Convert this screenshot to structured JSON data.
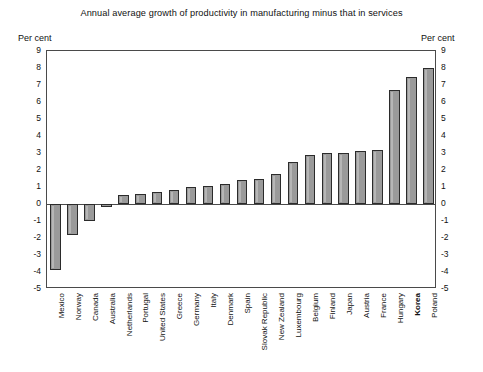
{
  "chart_data": {
    "type": "bar",
    "title": "Annual average growth of productivity in manufacturing minus that in services",
    "xlabel": "",
    "ylabel": "Per cent",
    "ylabel_right": "Per cent",
    "ylim": [
      -5,
      9
    ],
    "yticks": [
      9,
      8,
      7,
      6,
      5,
      4,
      3,
      2,
      1,
      0,
      -1,
      -2,
      -3,
      -4,
      -5
    ],
    "ytick_labels": [
      "9",
      "8",
      "7",
      "6",
      "5",
      "4",
      "3",
      "2",
      "1",
      "0",
      "-1",
      "-2",
      "-3",
      "-4",
      "-5"
    ],
    "grid": false,
    "legend": null,
    "bar_color": "#9a9a9a",
    "bar_edge_color": "#2b2b2b",
    "frame_color": "#4a4a4a",
    "highlight_category": "Korea",
    "categories": [
      "Mexico",
      "Norway",
      "Canada",
      "Australia",
      "Netherlands",
      "Portugal",
      "United States",
      "Greece",
      "Germany",
      "Italy",
      "Denmark",
      "Spain",
      "Slovak Republic",
      "New Zealand",
      "Luxembourg",
      "Belgium",
      "Finland",
      "Japan",
      "Austria",
      "France",
      "Hungary",
      "Korea",
      "Poland"
    ],
    "values": [
      -3.9,
      -1.8,
      -1.0,
      -0.2,
      0.55,
      0.6,
      0.7,
      0.85,
      1.0,
      1.05,
      1.2,
      1.4,
      1.45,
      1.75,
      2.45,
      2.9,
      3.0,
      3.0,
      3.1,
      3.15,
      6.7,
      7.5,
      8.0
    ]
  }
}
